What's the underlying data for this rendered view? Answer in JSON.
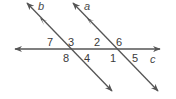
{
  "diagram": {
    "type": "parallel lines cut by transversal",
    "line_color": "#555555",
    "lines": [
      {
        "name": "b",
        "label": "b",
        "x1": 27,
        "y1": 3,
        "x2": 112,
        "y2": 91
      },
      {
        "name": "a",
        "label": "a",
        "x1": 73,
        "y1": 3,
        "x2": 158,
        "y2": 91
      },
      {
        "name": "c",
        "label": "c",
        "x1": 15,
        "y1": 49,
        "x2": 160,
        "y2": 49
      }
    ],
    "line_labels": {
      "b": "b",
      "a": "a",
      "c": "c"
    },
    "angles": {
      "a7": "7",
      "a3": "3",
      "a8": "8",
      "a4": "4",
      "a2": "2",
      "a6": "6",
      "a1": "1",
      "a5": "5"
    }
  }
}
